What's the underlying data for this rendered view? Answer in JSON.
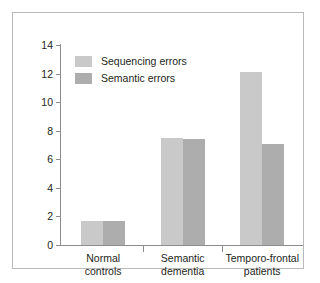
{
  "chart_data": {
    "type": "bar",
    "title": "",
    "subtitle": "",
    "xlabel": "",
    "ylabel": "",
    "ylim": [
      0,
      14
    ],
    "yticks": [
      0,
      2,
      4,
      6,
      8,
      10,
      12,
      14
    ],
    "ytick_labels": [
      "0",
      "2",
      "4",
      "6",
      "8",
      "10",
      "12",
      "14"
    ],
    "grid": false,
    "legend_position": "top-left",
    "categories": [
      "Normal controls",
      "Semantic dementia",
      "Temporo-frontal patients"
    ],
    "category_lines": [
      [
        "Normal",
        "controls"
      ],
      [
        "Semantic",
        "dementia"
      ],
      [
        "Temporo-frontal",
        "patients"
      ]
    ],
    "series": [
      {
        "name": "Sequencing errors",
        "color": "#c9c9c9",
        "values": [
          1.7,
          7.5,
          12.1
        ]
      },
      {
        "name": "Semantic errors",
        "color": "#adadad",
        "values": [
          1.7,
          7.4,
          7.1
        ]
      }
    ],
    "axis_color": "#8d8d8d",
    "text_color": "#231f20",
    "frame_color": "#b9b9b9",
    "background": "#ffffff"
  }
}
